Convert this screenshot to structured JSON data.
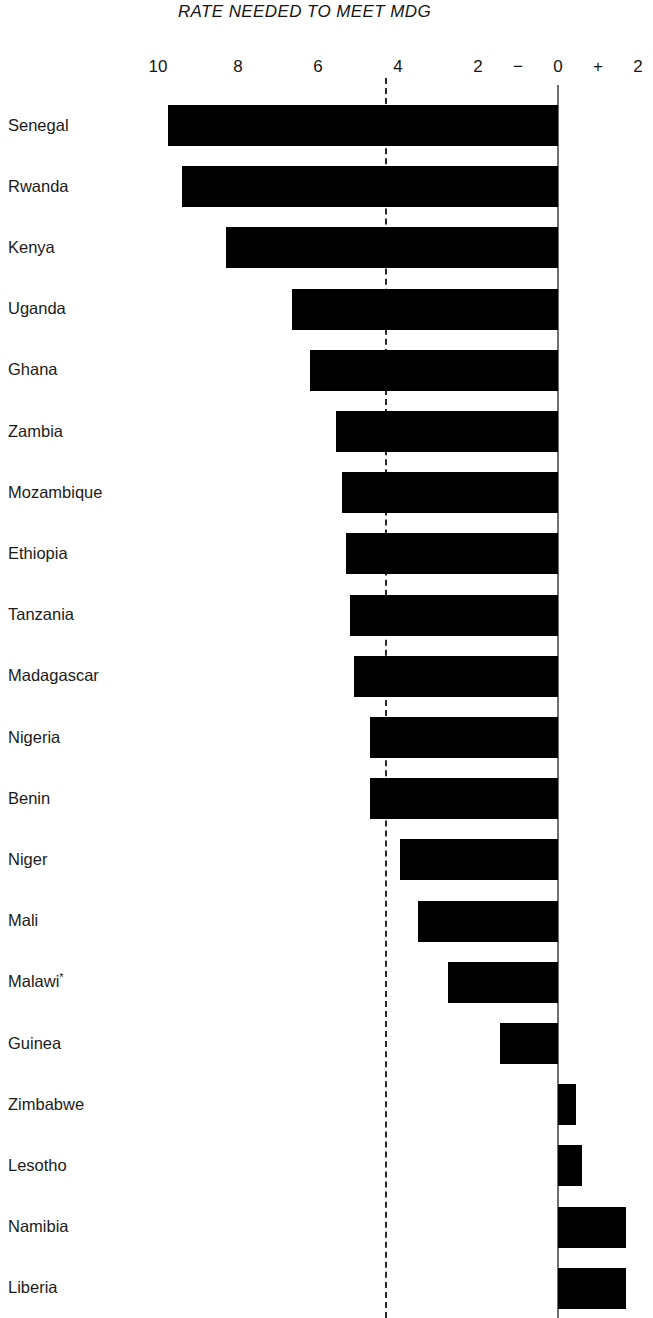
{
  "chart_data": {
    "type": "bar",
    "orientation": "horizontal",
    "title": "RATE NEEDED TO MEET MDG",
    "xlabel": "",
    "ylabel": "",
    "xlim": [
      10.9,
      -2.3
    ],
    "x_axis_direction": "reversed",
    "grid": false,
    "legend": "none",
    "tick_values": [
      10,
      8,
      6,
      4,
      2,
      0,
      2
    ],
    "tick_labels": [
      "10",
      "8",
      "6",
      "4",
      "2",
      "0",
      "2"
    ],
    "sign_markers": [
      {
        "label": "−",
        "value": 1.0
      },
      {
        "label": "+",
        "value": -1.0
      }
    ],
    "zero_line_value": 0,
    "reference_line": {
      "value": 4.3,
      "style": "dashed",
      "label": ""
    },
    "footnote_marker": "*",
    "categories": [
      "Senegal",
      "Rwanda",
      "Kenya",
      "Uganda",
      "Ghana",
      "Zambia",
      "Mozambique",
      "Ethiopia",
      "Tanzania",
      "Madagascar",
      "Nigeria",
      "Benin",
      "Niger",
      "Mali",
      "Malawi",
      "Guinea",
      "Zimbabwe",
      "Lesotho",
      "Namibia",
      "Liberia"
    ],
    "values": [
      9.75,
      9.4,
      8.3,
      6.65,
      6.2,
      5.55,
      5.4,
      5.3,
      5.2,
      5.1,
      4.7,
      4.7,
      3.95,
      3.5,
      2.75,
      1.45,
      -0.45,
      -0.6,
      -1.7,
      -1.7
    ],
    "series": [
      {
        "name": "Rate needed to meet MDG",
        "values": [
          9.75,
          9.4,
          8.3,
          6.65,
          6.2,
          5.55,
          5.4,
          5.3,
          5.2,
          5.1,
          4.7,
          4.7,
          3.95,
          3.5,
          2.75,
          1.45,
          -0.45,
          -0.6,
          -1.7,
          -1.7
        ]
      }
    ],
    "bar_color": "#000000",
    "zero_line_color": "#6f6f6f",
    "reference_line_color": "#2a2a2a",
    "background_color": "#ffffff",
    "category_annotations": {
      "Malawi": "*"
    }
  }
}
